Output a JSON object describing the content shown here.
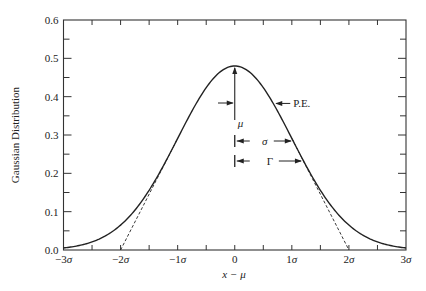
{
  "chart_data": {
    "type": "line",
    "title": "",
    "xlabel": "x − μ",
    "ylabel": "Gaussian Distribution",
    "xlim": [
      -3,
      3
    ],
    "ylim": [
      0,
      0.6
    ],
    "grid": false,
    "legend": null,
    "x_unit": "σ",
    "x_ticks": [
      -3,
      -2,
      -1,
      0,
      1,
      2,
      3
    ],
    "x_tick_labels": [
      "−3σ",
      "−2σ",
      "−1σ",
      "0",
      "1σ",
      "2σ",
      "3σ"
    ],
    "x_minor_ticks": [
      -2.5,
      -1.5,
      -0.5,
      0.5,
      1.5,
      2.5
    ],
    "y_ticks": [
      0.0,
      0.1,
      0.2,
      0.3,
      0.4,
      0.5,
      0.6
    ],
    "y_tick_labels": [
      "0.0",
      "0.1",
      "0.2",
      "0.3",
      "0.4",
      "0.5",
      "0.6"
    ],
    "y_minor_ticks": [
      0.05,
      0.15,
      0.25,
      0.35,
      0.45,
      0.55
    ],
    "series": [
      {
        "name": "Gaussian",
        "style": "solid",
        "function": "0.48 * exp(-x^2 / 2)",
        "x": [
          -3,
          -2.5,
          -2,
          -1.5,
          -1,
          -0.5,
          0,
          0.5,
          1,
          1.5,
          2,
          2.5,
          3
        ],
        "y": [
          0.005,
          0.021,
          0.065,
          0.156,
          0.291,
          0.424,
          0.48,
          0.424,
          0.291,
          0.156,
          0.065,
          0.021,
          0.005
        ]
      },
      {
        "name": "Left inflection tangent",
        "style": "dashed",
        "x": [
          -2,
          -1
        ],
        "y": [
          0,
          0.291
        ]
      },
      {
        "name": "Right inflection tangent",
        "style": "dashed",
        "x": [
          1,
          2
        ],
        "y": [
          0.291,
          0
        ]
      }
    ],
    "annotations": [
      {
        "label": "μ",
        "type": "vertical-line-with-arrow",
        "x": 0,
        "note": "mean, arrow up to peak"
      },
      {
        "label": "P.E.",
        "type": "arrow-to-curve",
        "x": 0.6745,
        "note": "probable error"
      },
      {
        "label": "σ",
        "type": "span-arrow",
        "from": 0,
        "to": 1,
        "note": "standard deviation"
      },
      {
        "label": "Γ",
        "type": "span-arrow",
        "from": 0,
        "to": 1.1774,
        "note": "half width at half maximum"
      }
    ]
  }
}
